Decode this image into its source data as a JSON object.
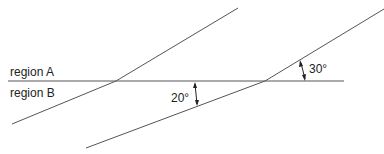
{
  "diagram": {
    "regions": {
      "upper_label": "region A",
      "lower_label": "region B"
    },
    "angles": {
      "left_angle_label": "20°",
      "right_angle_label": "30°"
    },
    "colors": {
      "line": "#555555",
      "text": "#222222"
    }
  }
}
